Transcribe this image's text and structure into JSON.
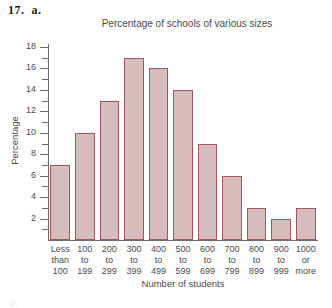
{
  "problem": {
    "number": "17.",
    "part": "a."
  },
  "footer": {
    "partial_next": "b."
  },
  "colors": {
    "bar_fill": "#d6bcbd",
    "bar_border": "#a1555d",
    "axis": "#6b6b6b",
    "text": "#4a4a4a",
    "background": "#ffffff"
  },
  "chart_data": {
    "type": "bar",
    "title": "Percentage of schools of various sizes",
    "xlabel": "Number of students",
    "ylabel": "Percentage",
    "categories": [
      "Less than 100",
      "100 to 199",
      "200 to 299",
      "300 to 399",
      "400 to 499",
      "500 to 599",
      "600 to 699",
      "700 to 799",
      "800 to 899",
      "900 to 999",
      "1000 or more"
    ],
    "category_lines": [
      [
        "Less",
        "than",
        "100"
      ],
      [
        "100",
        "to",
        "199"
      ],
      [
        "200",
        "to",
        "299"
      ],
      [
        "300",
        "to",
        "399"
      ],
      [
        "400",
        "to",
        "499"
      ],
      [
        "500",
        "to",
        "599"
      ],
      [
        "600",
        "to",
        "699"
      ],
      [
        "700",
        "to",
        "799"
      ],
      [
        "800",
        "to",
        "899"
      ],
      [
        "900",
        "to",
        "999"
      ],
      [
        "1000",
        "or",
        "more"
      ]
    ],
    "values": [
      7,
      10,
      13,
      17,
      16,
      14,
      9,
      6,
      3,
      2,
      3
    ],
    "ylim": [
      0,
      18
    ],
    "ytick_labels": [
      "2",
      "4",
      "6",
      "8",
      "10",
      "12",
      "14",
      "16",
      "18"
    ],
    "ytick_values": [
      2,
      4,
      6,
      8,
      10,
      12,
      14,
      16,
      18
    ],
    "yminor_values": [
      1,
      3,
      5,
      7,
      9,
      11,
      13,
      15,
      17
    ],
    "grid": false,
    "legend": false
  }
}
